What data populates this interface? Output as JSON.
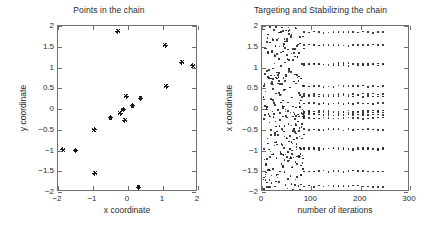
{
  "figure": {
    "background_color": "#ffffff",
    "axis_color": "#6e6e6e",
    "marker_color": "#1a1a1a"
  },
  "chart_data": [
    {
      "type": "scatter",
      "panel": "left",
      "title": "Points in the chain",
      "xlabel": "x coordinate",
      "ylabel": "y coordinate",
      "xlim": [
        -2,
        2
      ],
      "ylim": [
        -2,
        2
      ],
      "xticks": [
        -2,
        -1,
        0,
        1,
        2
      ],
      "xticklabels": [
        "-2",
        "-1",
        "0",
        "1",
        "2"
      ],
      "yticks": [
        -2,
        -1.5,
        -1,
        -0.5,
        0,
        0.5,
        1,
        1.5,
        2
      ],
      "yticklabels": [
        "-2",
        "-1.5",
        "-1",
        "-0.5",
        "0",
        "0.5",
        "1",
        "1.5",
        "2"
      ],
      "grid": false,
      "legend": null,
      "marker": "star",
      "points": [
        [
          -1.86,
          -0.98
        ],
        [
          -1.5,
          -1.0
        ],
        [
          -0.97,
          -0.5
        ],
        [
          -0.95,
          -1.55
        ],
        [
          -0.5,
          -0.21
        ],
        [
          -0.29,
          1.87
        ],
        [
          -0.22,
          -0.1
        ],
        [
          -0.14,
          -0.01
        ],
        [
          -0.09,
          -0.27
        ],
        [
          -0.05,
          0.31
        ],
        [
          0.13,
          0.08
        ],
        [
          0.3,
          -1.88
        ],
        [
          0.36,
          0.26
        ],
        [
          1.06,
          1.54
        ],
        [
          1.09,
          0.55
        ],
        [
          1.54,
          1.13
        ],
        [
          1.85,
          1.04
        ]
      ]
    },
    {
      "type": "scatter",
      "panel": "right",
      "title": "Targeting and Stabilizing the chain",
      "xlabel": "number of iterations",
      "ylabel": "x coordinate",
      "xlim": [
        0,
        300
      ],
      "ylim": [
        -2,
        2
      ],
      "xticks": [
        0,
        100,
        200,
        300
      ],
      "xticklabels": [
        "0",
        "100",
        "200",
        "300"
      ],
      "yticks": [
        -2,
        -1.5,
        -1,
        -0.5,
        0,
        0.5,
        1,
        1.5,
        2
      ],
      "yticklabels": [
        "-2",
        "-1.5",
        "-1",
        "-0.5",
        "0",
        "0.5",
        "1",
        "1.5",
        "2"
      ],
      "grid": false,
      "legend": null,
      "marker": "dot",
      "description": "Transient scattered phase for iterations 0-80, then 17 stabilized horizontal bands of x-coordinates up to iteration ~250",
      "stabilized_levels": [
        1.85,
        1.54,
        1.09,
        1.06,
        0.55,
        0.36,
        0.31,
        0.13,
        -0.05,
        -0.09,
        -0.14,
        -0.22,
        -0.5,
        -0.95,
        -0.97,
        -1.5,
        -1.86
      ],
      "stabilize_start_iteration": 85,
      "stabilize_end_iteration": 250,
      "transient_points": [
        [
          4,
          1.92
        ],
        [
          6,
          -0.14
        ],
        [
          7,
          0.42
        ],
        [
          8,
          -1.32
        ],
        [
          9,
          1.46
        ],
        [
          10,
          0.06
        ],
        [
          11,
          -0.71
        ],
        [
          12,
          1.8
        ],
        [
          13,
          -1.88
        ],
        [
          14,
          0.94
        ],
        [
          15,
          -0.33
        ],
        [
          16,
          1.6
        ],
        [
          17,
          -1.02
        ],
        [
          18,
          0.24
        ],
        [
          19,
          -1.6
        ],
        [
          20,
          1.36
        ],
        [
          21,
          -0.06
        ],
        [
          22,
          0.72
        ],
        [
          23,
          -1.46
        ],
        [
          24,
          1.9
        ],
        [
          25,
          -0.88
        ],
        [
          26,
          0.1
        ],
        [
          27,
          1.52
        ],
        [
          28,
          -0.42
        ],
        [
          29,
          -1.18
        ],
        [
          30,
          0.88
        ],
        [
          31,
          1.66
        ],
        [
          32,
          -0.02
        ],
        [
          33,
          -0.62
        ],
        [
          34,
          1.2
        ],
        [
          35,
          -1.76
        ],
        [
          36,
          0.34
        ],
        [
          37,
          -0.26
        ],
        [
          38,
          1.04
        ],
        [
          39,
          -1.08
        ],
        [
          40,
          0.6
        ],
        [
          41,
          -0.48
        ],
        [
          42,
          1.88
        ],
        [
          43,
          0.02
        ],
        [
          44,
          -0.94
        ],
        [
          45,
          0.46
        ],
        [
          46,
          -1.52
        ],
        [
          47,
          1.12
        ],
        [
          48,
          -0.18
        ],
        [
          49,
          0.78
        ],
        [
          50,
          -0.7
        ],
        [
          51,
          1.3
        ],
        [
          52,
          -1.92
        ],
        [
          53,
          0.16
        ],
        [
          54,
          -0.36
        ],
        [
          55,
          0.98
        ],
        [
          56,
          -1.24
        ],
        [
          57,
          0.52
        ],
        [
          58,
          -0.08
        ],
        [
          59,
          1.74
        ],
        [
          60,
          -0.8
        ],
        [
          61,
          0.28
        ],
        [
          62,
          -1.4
        ],
        [
          63,
          1.18
        ],
        [
          64,
          -0.54
        ],
        [
          65,
          0.66
        ],
        [
          66,
          -0.12
        ],
        [
          67,
          1.44
        ],
        [
          68,
          -1.7
        ],
        [
          69,
          0.04
        ],
        [
          70,
          -0.98
        ],
        [
          71,
          0.82
        ],
        [
          72,
          1.26
        ],
        [
          73,
          -0.3
        ],
        [
          74,
          -1.86
        ],
        [
          75,
          0.38
        ],
        [
          76,
          -0.66
        ],
        [
          77,
          1.58
        ],
        [
          78,
          -1.14
        ],
        [
          79,
          0.2
        ],
        [
          80,
          -0.44
        ],
        [
          81,
          1.08
        ],
        [
          82,
          -1.3
        ],
        [
          83,
          0.56
        ],
        [
          84,
          -0.22
        ]
      ]
    }
  ]
}
